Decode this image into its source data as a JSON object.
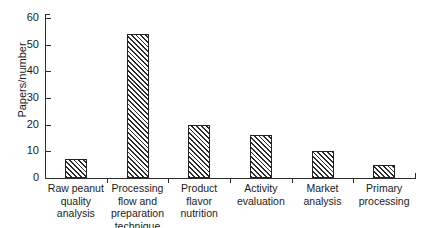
{
  "chart_data": {
    "type": "bar",
    "title": "",
    "xlabel": "",
    "ylabel": "Papers/number",
    "categories": [
      "Raw peanut quality analysis",
      "Processing flow and preparation technique",
      "Product flavor nutrition",
      "Activity evaluation",
      "Market analysis",
      "Primary processing"
    ],
    "values": [
      7,
      54,
      20,
      16,
      10,
      5
    ],
    "ylim": [
      0,
      60
    ],
    "yticks": [
      0,
      10,
      20,
      30,
      40,
      50,
      60
    ],
    "ytick_labels": [
      "0",
      "10",
      "20",
      "30",
      "40",
      "50",
      "60"
    ],
    "grid": false,
    "legend": null,
    "bar_style": {
      "fill": "diagonal-hatch",
      "hatch_color": "#2b2b2b",
      "background": "#ffffff",
      "border_color": "#232323"
    }
  },
  "axes": {
    "y_title": "Papers/number"
  }
}
